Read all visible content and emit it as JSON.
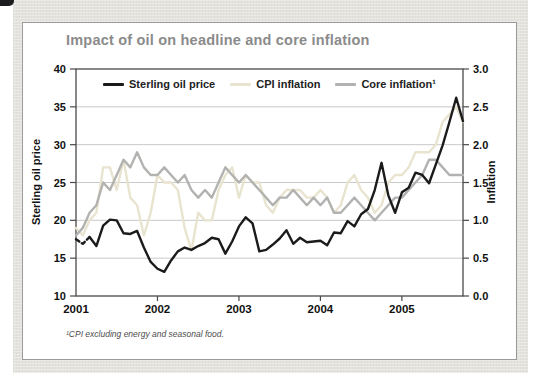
{
  "footnote": "¹CPI excluding energy and seasonal food.",
  "colors": {
    "title_gray": "#8b8b8b",
    "panel_background": "#e3e2dd",
    "card_border": "#9a9a9a",
    "grid_line": "#c9c9c9",
    "axis_line": "#4a4a4a"
  },
  "chart_data": {
    "type": "line",
    "title": "Impact of oil on headline and core inflation",
    "x_years": [
      "2001",
      "2002",
      "2003",
      "2004",
      "2005"
    ],
    "left_axis": {
      "label": "Sterling oil price",
      "min": 10,
      "max": 40,
      "ticks": [
        "40",
        "35",
        "30",
        "25",
        "20",
        "15",
        "10"
      ]
    },
    "right_axis": {
      "label": "Inflation",
      "min": 0.0,
      "max": 3.0,
      "ticks": [
        "3.0",
        "2.5",
        "2.0",
        "1.5",
        "1.0",
        "0.5",
        "0.0"
      ]
    },
    "grid": "horizontal",
    "legend_position": "top-inside",
    "series": [
      {
        "name": "Sterling oil price",
        "axis": "left",
        "color": "#1b1b1b",
        "dashed_start": true,
        "values": [
          17.5,
          16.9,
          17.8,
          16.6,
          19.3,
          20.1,
          20.0,
          18.3,
          18.2,
          18.6,
          16.4,
          14.5,
          13.6,
          13.2,
          14.7,
          15.9,
          16.4,
          16.1,
          16.6,
          17.0,
          17.7,
          17.5,
          15.6,
          17.2,
          19.2,
          20.4,
          19.6,
          15.9,
          16.1,
          16.8,
          17.6,
          18.7,
          16.9,
          17.7,
          17.1,
          17.2,
          17.3,
          16.7,
          18.4,
          18.3,
          19.9,
          19.2,
          20.8,
          21.5,
          24.0,
          27.6,
          23.3,
          21.0,
          23.7,
          24.3,
          26.3,
          26.0,
          24.9,
          27.4,
          29.9,
          33.0,
          36.2,
          33.1
        ]
      },
      {
        "name": "CPI inflation",
        "axis": "right",
        "color": "#e8e4cf",
        "dashed_start": false,
        "values": [
          0.9,
          0.8,
          1.0,
          1.1,
          1.7,
          1.7,
          1.4,
          1.8,
          1.3,
          1.2,
          0.8,
          1.1,
          1.6,
          1.5,
          1.5,
          1.4,
          0.9,
          0.6,
          1.1,
          1.0,
          1.0,
          1.4,
          1.6,
          1.7,
          1.3,
          1.6,
          1.5,
          1.5,
          1.2,
          1.1,
          1.3,
          1.4,
          1.4,
          1.4,
          1.3,
          1.3,
          1.4,
          1.3,
          1.1,
          1.2,
          1.5,
          1.6,
          1.4,
          1.3,
          1.1,
          1.2,
          1.5,
          1.6,
          1.6,
          1.7,
          1.9,
          1.9,
          1.9,
          2.0,
          2.3,
          2.4,
          2.5,
          2.3
        ]
      },
      {
        "name": "Core inflation¹",
        "axis": "right",
        "color": "#b2b2b0",
        "dashed_start": false,
        "values": [
          0.8,
          0.9,
          1.1,
          1.2,
          1.5,
          1.4,
          1.6,
          1.8,
          1.7,
          1.9,
          1.7,
          1.6,
          1.6,
          1.7,
          1.6,
          1.5,
          1.6,
          1.4,
          1.3,
          1.4,
          1.3,
          1.5,
          1.7,
          1.6,
          1.5,
          1.6,
          1.5,
          1.4,
          1.3,
          1.2,
          1.3,
          1.3,
          1.4,
          1.3,
          1.2,
          1.3,
          1.2,
          1.3,
          1.1,
          1.1,
          1.2,
          1.3,
          1.2,
          1.1,
          1.0,
          1.1,
          1.2,
          1.3,
          1.3,
          1.4,
          1.5,
          1.6,
          1.8,
          1.8,
          1.7,
          1.6,
          1.6,
          1.6
        ]
      }
    ]
  }
}
